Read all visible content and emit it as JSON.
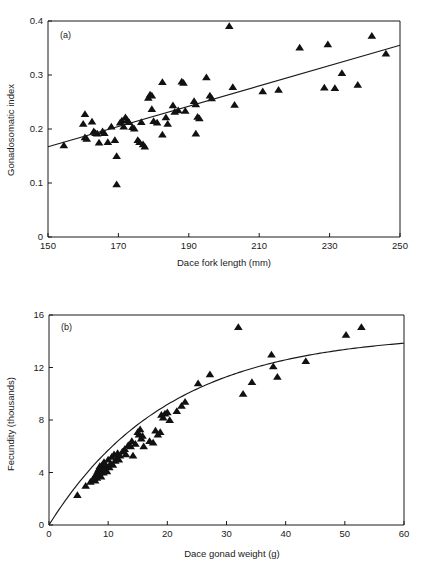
{
  "figure": {
    "panels": [
      "a",
      "b"
    ],
    "background": "#ffffff",
    "ink": "#111111"
  },
  "panel_a": {
    "label": "(a)",
    "xlabel": "Dace fork length (mm)",
    "ylabel": "Gonadosomatic index",
    "xticks": [
      "150",
      "170",
      "190",
      "210",
      "230",
      "250"
    ],
    "yticks": [
      "0",
      "0.1",
      "0.2",
      "0.3",
      "0.4"
    ]
  },
  "panel_b": {
    "label": "(b)",
    "xlabel": "Dace gonad weight (g)",
    "ylabel": "Fecundity (thousands)",
    "xticks": [
      "0",
      "10",
      "20",
      "30",
      "40",
      "50",
      "60"
    ],
    "yticks": [
      "0",
      "4",
      "8",
      "12",
      "16"
    ]
  },
  "chart_data": [
    {
      "type": "scatter",
      "id": "a",
      "title": "(a)",
      "xlabel": "Dace fork length (mm)",
      "ylabel": "Gonadosomatic index",
      "xlim": [
        150,
        250
      ],
      "ylim": [
        0,
        0.4
      ],
      "xticks": [
        150,
        170,
        190,
        210,
        230,
        250
      ],
      "yticks": [
        0,
        0.1,
        0.2,
        0.3,
        0.4
      ],
      "grid": false,
      "legend": null,
      "marker": "triangle-up-filled",
      "points": [
        [
          154.5,
          0.17
        ],
        [
          160.5,
          0.228
        ],
        [
          160.0,
          0.21
        ],
        [
          160.5,
          0.185
        ],
        [
          161.0,
          0.182
        ],
        [
          162.5,
          0.214
        ],
        [
          163.0,
          0.196
        ],
        [
          163.5,
          0.193
        ],
        [
          164.0,
          0.192
        ],
        [
          164.5,
          0.175
        ],
        [
          165.5,
          0.196
        ],
        [
          166.0,
          0.193
        ],
        [
          167.0,
          0.176
        ],
        [
          168.0,
          0.205
        ],
        [
          169.0,
          0.18
        ],
        [
          169.5,
          0.15
        ],
        [
          169.5,
          0.098
        ],
        [
          170.5,
          0.212
        ],
        [
          171.0,
          0.216
        ],
        [
          171.5,
          0.205
        ],
        [
          172.0,
          0.222
        ],
        [
          172.5,
          0.217
        ],
        [
          173.0,
          0.213
        ],
        [
          174.0,
          0.204
        ],
        [
          174.5,
          0.201
        ],
        [
          175.5,
          0.18
        ],
        [
          176.0,
          0.176
        ],
        [
          176.5,
          0.213
        ],
        [
          177.0,
          0.172
        ],
        [
          177.5,
          0.168
        ],
        [
          178.5,
          0.258
        ],
        [
          179.0,
          0.264
        ],
        [
          179.5,
          0.262
        ],
        [
          179.5,
          0.237
        ],
        [
          180.0,
          0.215
        ],
        [
          181.0,
          0.212
        ],
        [
          182.5,
          0.287
        ],
        [
          182.5,
          0.19
        ],
        [
          183.5,
          0.222
        ],
        [
          184.0,
          0.21
        ],
        [
          185.5,
          0.244
        ],
        [
          186.0,
          0.232
        ],
        [
          187.0,
          0.235
        ],
        [
          188.0,
          0.288
        ],
        [
          188.5,
          0.286
        ],
        [
          189.0,
          0.234
        ],
        [
          191.5,
          0.252
        ],
        [
          192.0,
          0.246
        ],
        [
          192.5,
          0.223
        ],
        [
          192.0,
          0.192
        ],
        [
          193.0,
          0.22
        ],
        [
          195.0,
          0.296
        ],
        [
          196.0,
          0.262
        ],
        [
          196.5,
          0.257
        ],
        [
          201.5,
          0.391
        ],
        [
          202.5,
          0.278
        ],
        [
          203.0,
          0.245
        ],
        [
          211.0,
          0.27
        ],
        [
          215.5,
          0.273
        ],
        [
          221.5,
          0.351
        ],
        [
          228.5,
          0.277
        ],
        [
          229.5,
          0.357
        ],
        [
          231.5,
          0.276
        ],
        [
          233.5,
          0.304
        ],
        [
          238.0,
          0.282
        ],
        [
          242.0,
          0.373
        ],
        [
          246.0,
          0.34
        ]
      ],
      "fit_line": {
        "kind": "linear",
        "x": [
          150,
          250
        ],
        "y": [
          0.167,
          0.355
        ]
      }
    },
    {
      "type": "scatter",
      "id": "b",
      "title": "(b)",
      "xlabel": "Dace gonad weight (g)",
      "ylabel": "Fecundity (thousands)",
      "xlim": [
        0,
        60
      ],
      "ylim": [
        0,
        16
      ],
      "xticks": [
        0,
        10,
        20,
        30,
        40,
        50,
        60
      ],
      "yticks": [
        0,
        4,
        8,
        12,
        16
      ],
      "grid": false,
      "legend": null,
      "marker": "triangle-up-filled",
      "points": [
        [
          4.8,
          2.3
        ],
        [
          6.2,
          3.0
        ],
        [
          7.0,
          3.3
        ],
        [
          7.4,
          3.5
        ],
        [
          7.6,
          3.6
        ],
        [
          7.8,
          3.4
        ],
        [
          8.0,
          3.9
        ],
        [
          8.1,
          3.6
        ],
        [
          8.2,
          4.1
        ],
        [
          8.3,
          3.8
        ],
        [
          8.4,
          4.3
        ],
        [
          8.5,
          4.0
        ],
        [
          8.6,
          4.5
        ],
        [
          8.7,
          4.2
        ],
        [
          8.8,
          3.7
        ],
        [
          8.9,
          4.4
        ],
        [
          9.0,
          4.6
        ],
        [
          9.1,
          4.2
        ],
        [
          9.2,
          4.0
        ],
        [
          9.3,
          4.8
        ],
        [
          9.4,
          4.3
        ],
        [
          9.6,
          4.5
        ],
        [
          9.8,
          4.1
        ],
        [
          10.0,
          5.0
        ],
        [
          10.2,
          4.4
        ],
        [
          10.4,
          4.7
        ],
        [
          10.6,
          5.2
        ],
        [
          10.8,
          4.6
        ],
        [
          11.0,
          5.4
        ],
        [
          11.2,
          4.9
        ],
        [
          11.4,
          5.1
        ],
        [
          11.6,
          5.5
        ],
        [
          11.8,
          5.0
        ],
        [
          12.0,
          5.3
        ],
        [
          12.4,
          5.6
        ],
        [
          12.8,
          5.8
        ],
        [
          13.0,
          5.4
        ],
        [
          13.4,
          6.1
        ],
        [
          13.8,
          6.0
        ],
        [
          14.0,
          6.4
        ],
        [
          14.2,
          5.3
        ],
        [
          14.6,
          6.2
        ],
        [
          15.0,
          7.1
        ],
        [
          15.2,
          6.9
        ],
        [
          15.4,
          7.3
        ],
        [
          15.6,
          6.6
        ],
        [
          15.8,
          6.8
        ],
        [
          16.0,
          6.0
        ],
        [
          17.0,
          6.4
        ],
        [
          17.6,
          6.3
        ],
        [
          18.0,
          7.2
        ],
        [
          18.4,
          6.9
        ],
        [
          18.8,
          7.1
        ],
        [
          19.0,
          8.4
        ],
        [
          19.3,
          8.2
        ],
        [
          19.6,
          8.5
        ],
        [
          20.0,
          8.6
        ],
        [
          20.4,
          8.0
        ],
        [
          21.6,
          8.7
        ],
        [
          22.4,
          9.1
        ],
        [
          23.0,
          9.4
        ],
        [
          25.2,
          10.8
        ],
        [
          27.2,
          11.5
        ],
        [
          32.0,
          15.1
        ],
        [
          32.8,
          10.0
        ],
        [
          34.3,
          10.9
        ],
        [
          37.6,
          13.0
        ],
        [
          37.9,
          12.1
        ],
        [
          38.6,
          11.3
        ],
        [
          43.4,
          12.5
        ],
        [
          50.2,
          14.5
        ],
        [
          52.8,
          15.1
        ]
      ],
      "fit_curve": {
        "kind": "asymptotic",
        "asymptote": 14.6,
        "rate": 0.0495,
        "description": "y = 14.6 * (1 - exp(-0.0495 * x))"
      }
    }
  ]
}
